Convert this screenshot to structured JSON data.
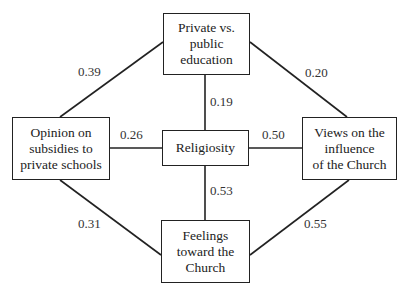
{
  "nodes": {
    "top": "Private vs.\npublic\neducation",
    "left": "Opinion on\nsubsidies to\nprivate schools",
    "center": "Religiosity",
    "right": "Views on the\ninfluence\nof the Church",
    "bottom": "Feelings\ntoward the\nChurch"
  },
  "edges": {
    "top_left": "0.39",
    "top_right": "0.20",
    "top_center": "0.19",
    "left_center": "0.26",
    "center_right": "0.50",
    "center_bottom": "0.53",
    "left_bottom": "0.31",
    "right_bottom": "0.55"
  },
  "colors": {
    "line": "#222222",
    "background": "#ffffff"
  }
}
